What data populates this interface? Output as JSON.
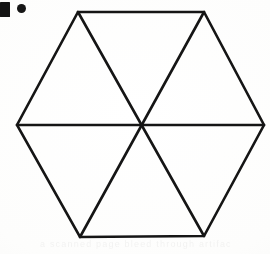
{
  "page": {
    "width": 270,
    "height": 254,
    "background_color": "#fcfcfb",
    "ink_color": "#151515",
    "ghost_text": "a scanned page bleed through artifact"
  },
  "marker": {
    "square_label": "list-marker-square",
    "dot_label": "list-marker-dot"
  },
  "figure": {
    "shape": "hexagon",
    "stroke_color": "#151515",
    "fill_color": "none",
    "stroke_width": 2.6,
    "center": {
      "x": 141,
      "y": 125
    },
    "vertices": [
      {
        "name": "top-left",
        "x": 78,
        "y": 12
      },
      {
        "name": "top-right",
        "x": 204,
        "y": 12
      },
      {
        "name": "right",
        "x": 264,
        "y": 125
      },
      {
        "name": "bottom-right",
        "x": 204,
        "y": 236
      },
      {
        "name": "bottom-left",
        "x": 80,
        "y": 237
      },
      {
        "name": "left",
        "x": 17,
        "y": 125
      }
    ],
    "diagonals": [
      {
        "name": "horizontal-diagonal",
        "from": "left",
        "to": "right"
      },
      {
        "name": "top-left-to-bottom-right",
        "from": "top-left",
        "to": "bottom-right"
      },
      {
        "name": "top-right-to-bottom-left",
        "from": "top-right",
        "to": "bottom-left"
      }
    ],
    "triangle_count": 6
  }
}
